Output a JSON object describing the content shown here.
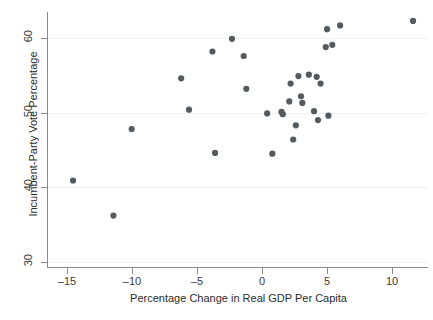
{
  "chart_data": {
    "type": "scatter",
    "title": "",
    "xlabel": "Percentage Change in Real GDP Per Capita",
    "ylabel": "Incumbent-Party Vote Percentage",
    "xlim": [
      -16.5,
      12.9
    ],
    "ylim": [
      29.3,
      63.5
    ],
    "xticks": [
      -15,
      -10,
      -5,
      0,
      5,
      10
    ],
    "xticklabels": [
      "–15",
      "–10",
      "–5",
      "0",
      "5",
      "10"
    ],
    "yticks": [
      30,
      40,
      50,
      60
    ],
    "yticklabels": [
      "30",
      "40",
      "50",
      "60"
    ],
    "grid": "horizontal",
    "legend": "none",
    "marker": {
      "shape": "circle",
      "color": "#555a5e",
      "size": 3.1
    },
    "series": [
      {
        "name": "elections",
        "points": [
          {
            "x": -14.5,
            "y": 40.9
          },
          {
            "x": -11.4,
            "y": 36.2
          },
          {
            "x": -10.0,
            "y": 47.8
          },
          {
            "x": -6.2,
            "y": 54.6
          },
          {
            "x": -5.6,
            "y": 50.4
          },
          {
            "x": -3.8,
            "y": 58.2
          },
          {
            "x": -3.6,
            "y": 44.6
          },
          {
            "x": -2.3,
            "y": 59.9
          },
          {
            "x": -1.4,
            "y": 57.6
          },
          {
            "x": -1.2,
            "y": 53.2
          },
          {
            "x": 0.4,
            "y": 49.9
          },
          {
            "x": 0.8,
            "y": 44.5
          },
          {
            "x": 1.5,
            "y": 50.1
          },
          {
            "x": 1.6,
            "y": 49.8
          },
          {
            "x": 2.1,
            "y": 51.5
          },
          {
            "x": 2.2,
            "y": 53.9
          },
          {
            "x": 2.4,
            "y": 46.4
          },
          {
            "x": 2.6,
            "y": 48.3
          },
          {
            "x": 2.8,
            "y": 54.9
          },
          {
            "x": 3.0,
            "y": 52.2
          },
          {
            "x": 3.1,
            "y": 51.3
          },
          {
            "x": 3.6,
            "y": 55.1
          },
          {
            "x": 4.0,
            "y": 50.2
          },
          {
            "x": 4.2,
            "y": 54.8
          },
          {
            "x": 4.3,
            "y": 49.0
          },
          {
            "x": 4.5,
            "y": 53.9
          },
          {
            "x": 4.9,
            "y": 58.8
          },
          {
            "x": 5.0,
            "y": 61.2
          },
          {
            "x": 5.1,
            "y": 49.6
          },
          {
            "x": 5.4,
            "y": 59.1
          },
          {
            "x": 6.0,
            "y": 61.7
          },
          {
            "x": 11.6,
            "y": 62.3
          }
        ]
      }
    ]
  },
  "colors": {
    "marker": "#555a5e",
    "axis": "#8a8a8a",
    "grid": "#f1f1f1",
    "text": "#2b2b2b",
    "background": "#ffffff"
  }
}
